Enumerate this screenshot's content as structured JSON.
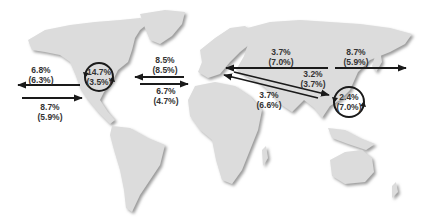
{
  "map": {
    "background": "#ffffff",
    "land_color": "#d9d9d9",
    "land_shadow": "#bdbdbd",
    "arrow_color": "#1a1a1a",
    "text_color": "#333333"
  },
  "flows": [
    {
      "id": "na-west-out",
      "from": "North America",
      "to": "West (Pacific)",
      "value": "6.8%",
      "sub": "(6.3%)",
      "direction": "left"
    },
    {
      "id": "na-west-in",
      "from": "West (Pacific)",
      "to": "North America",
      "value": "8.7%",
      "sub": "(5.9%)",
      "direction": "right"
    },
    {
      "id": "na-internal",
      "region": "North America",
      "value": "14.7%",
      "sub": "(3.5%)",
      "type": "cycle"
    },
    {
      "id": "atlantic-west",
      "from": "Europe",
      "to": "North America",
      "value": "8.5%",
      "sub": "(8.5%)",
      "direction": "left"
    },
    {
      "id": "atlantic-east",
      "from": "North America",
      "to": "Europe",
      "value": "6.7%",
      "sub": "(4.7%)",
      "direction": "right"
    },
    {
      "id": "asia-europe",
      "from": "Asia",
      "to": "Europe",
      "value": "3.7%",
      "sub": "(7.0%)",
      "direction": "left"
    },
    {
      "id": "asia-east-out",
      "from": "Asia",
      "to": "East (Pacific)",
      "value": "8.7%",
      "sub": "(5.9%)",
      "direction": "right"
    },
    {
      "id": "europe-asia-diag",
      "from": "Europe",
      "to": "Asia",
      "value": "3.2%",
      "sub": "(3.7%)",
      "direction": "down-right"
    },
    {
      "id": "asia-europe-diag",
      "from": "Asia",
      "to": "Europe",
      "value": "3.7%",
      "sub": "(6.6%)",
      "direction": "up-left"
    },
    {
      "id": "asia-internal",
      "region": "Asia",
      "value": "2.4%",
      "sub": "(7.0%)",
      "type": "cycle"
    }
  ],
  "labels": {
    "na_west_out": {
      "a": "6.8%",
      "b": "(6.3%)"
    },
    "na_west_in": {
      "a": "8.7%",
      "b": "(5.9%)"
    },
    "na_internal": {
      "a": "14.7%",
      "b": "(3.5%)"
    },
    "atlantic_west": {
      "a": "8.5%",
      "b": "(8.5%)"
    },
    "atlantic_east": {
      "a": "6.7%",
      "b": "(4.7%)"
    },
    "asia_europe": {
      "a": "3.7%",
      "b": "(7.0%)"
    },
    "asia_east_out": {
      "a": "8.7%",
      "b": "(5.9%)"
    },
    "europe_asia_diag": {
      "a": "3.2%",
      "b": "(3.7%)"
    },
    "asia_europe_diag": {
      "a": "3.7%",
      "b": "(6.6%)"
    },
    "asia_internal": {
      "a": "2.4%",
      "b": "(7.0%)"
    }
  }
}
